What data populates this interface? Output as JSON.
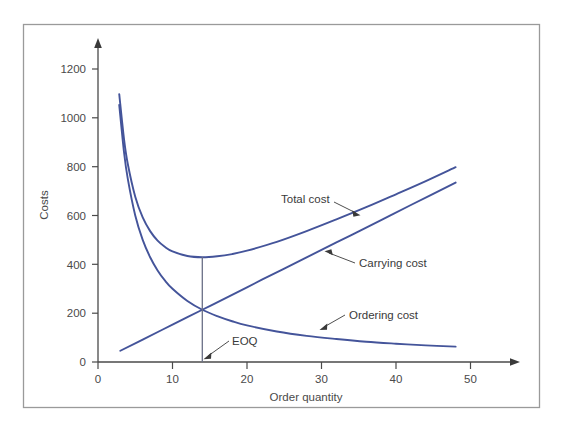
{
  "figure": {
    "frame": {
      "x": 23,
      "y": 24,
      "width": 517,
      "height": 384,
      "border_color": "#9a9a9a"
    },
    "background": "#ffffff"
  },
  "chart_data": {
    "type": "line",
    "title": "",
    "xlabel": "Order quantity",
    "ylabel": "Costs",
    "xlim": [
      0,
      55
    ],
    "ylim": [
      0,
      1280
    ],
    "xticks": [
      0,
      10,
      20,
      30,
      40,
      50
    ],
    "yticks": [
      0,
      200,
      400,
      600,
      800,
      1000,
      1200
    ],
    "grid": false,
    "legend": "none (inline curve labels with leader arrows)",
    "axis_style": "two-spine with arrowheads at the positive ends",
    "line_color": "#44549a",
    "series": [
      {
        "name": "Ordering cost",
        "type": "hyperbola",
        "formula": "y = 3000 / x",
        "x": [
          2.85,
          3.5,
          4,
          5,
          6,
          7,
          8,
          9,
          10,
          12,
          14,
          16,
          18,
          20,
          24,
          28,
          32,
          36,
          40,
          44,
          48
        ],
        "values": [
          1053,
          857,
          750,
          600,
          500,
          429,
          375,
          333,
          300,
          250,
          214,
          188,
          167,
          150,
          125,
          107,
          94,
          83,
          75,
          68,
          63
        ],
        "label_text": "Ordering cost",
        "label_x": 350,
        "label_y": 311
      },
      {
        "name": "Carrying cost",
        "type": "linear",
        "formula": "y = 15.3 * x",
        "x": [
          3,
          6,
          10,
          14,
          18,
          22,
          26,
          30,
          34,
          38,
          42,
          48
        ],
        "values": [
          46,
          92,
          153,
          214,
          275,
          337,
          398,
          459,
          520,
          581,
          643,
          735
        ],
        "label_text": "Carrying cost",
        "label_x": 362,
        "label_y": 262
      },
      {
        "name": "Total cost",
        "type": "sum",
        "formula": "y = 3000 / x + 15.3 * x",
        "x": [
          2.85,
          3.5,
          4,
          5,
          6,
          7,
          8,
          9,
          10,
          12,
          14,
          16,
          18,
          20,
          24,
          28,
          32,
          36,
          40,
          44,
          48
        ],
        "values": [
          1097,
          911,
          811,
          677,
          592,
          536,
          497,
          471,
          453,
          434,
          429,
          433,
          442,
          456,
          492,
          536,
          584,
          634,
          687,
          741,
          798
        ],
        "label_text": "Total cost",
        "label_x": 281,
        "label_y": 199
      }
    ],
    "annotations": [
      {
        "name": "eoq",
        "text": "EOQ",
        "x_value": 14,
        "y_value": 0,
        "marker": "vertical line at EOQ from axis to total-cost minimum",
        "minimum_total_cost": 430,
        "crossover_cost": 214
      }
    ]
  },
  "labels": {
    "total_cost": "Total cost",
    "carrying_cost": "Carrying cost",
    "ordering_cost": "Ordering cost",
    "eoq": "EOQ",
    "x_axis_title": "Order quantity",
    "y_axis_title": "Costs"
  },
  "ticks": {
    "x": [
      "0",
      "10",
      "20",
      "30",
      "40",
      "50"
    ],
    "y": [
      "0",
      "200",
      "400",
      "600",
      "800",
      "1000",
      "1200"
    ]
  },
  "colors": {
    "curve": "#44549a",
    "axis": "#4a4a4a",
    "text": "#4a4a4a",
    "frame": "#9a9a9a",
    "annotation": "#3a3a3a"
  }
}
